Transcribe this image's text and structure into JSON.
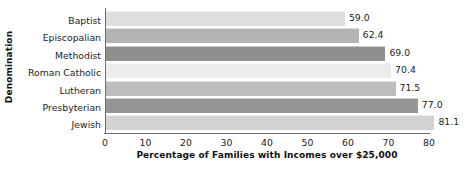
{
  "chart_data": {
    "type": "bar",
    "orientation": "horizontal",
    "title": "",
    "xlabel": "Percentage of Families with Incomes over $25,000",
    "ylabel": "Denomination",
    "categories": [
      "Baptist",
      "Episcopalian",
      "Methodist",
      "Roman Catholic",
      "Lutheran",
      "Presbyterian",
      "Jewish"
    ],
    "values": [
      59.0,
      62.4,
      69.0,
      70.4,
      71.5,
      77.0,
      81.1
    ],
    "value_labels": [
      "59.0",
      "62.4",
      "69.0",
      "70.4",
      "71.5",
      "77.0",
      "81.1"
    ],
    "bar_colors": [
      "#dededc",
      "#b4b4b2",
      "#8f8f8d",
      "#ececea",
      "#bdbdbb",
      "#969694",
      "#d2d2d0"
    ],
    "xlim": [
      0,
      80
    ],
    "x_ticks": [
      0,
      10,
      20,
      30,
      40,
      50,
      60,
      70,
      80
    ],
    "x_tick_labels": [
      "0",
      "10",
      "20",
      "30",
      "40",
      "50",
      "60",
      "70",
      "80"
    ],
    "grid": false,
    "legend": "none"
  }
}
